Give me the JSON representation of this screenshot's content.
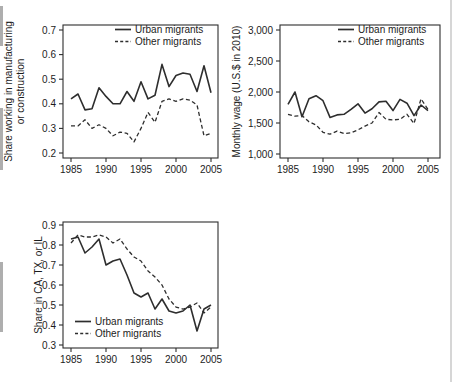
{
  "figure_caption": "",
  "chart_data": [
    {
      "id": "share-manufacturing-chart",
      "type": "line",
      "x": [
        1985,
        1986,
        1987,
        1988,
        1989,
        1990,
        1991,
        1992,
        1993,
        1994,
        1995,
        1996,
        1997,
        1998,
        1999,
        2000,
        2001,
        2002,
        2003,
        2004,
        2005
      ],
      "xlim": [
        1985,
        2005
      ],
      "series": [
        {
          "name": "Urban migrants",
          "line": "solid",
          "values": [
            0.42,
            0.44,
            0.375,
            0.38,
            0.465,
            0.43,
            0.4,
            0.4,
            0.45,
            0.41,
            0.49,
            0.42,
            0.435,
            0.56,
            0.47,
            0.515,
            0.525,
            0.52,
            0.45,
            0.555,
            0.445
          ]
        },
        {
          "name": "Other migrants",
          "line": "dashed",
          "values": [
            0.31,
            0.31,
            0.335,
            0.3,
            0.315,
            0.3,
            0.27,
            0.285,
            0.28,
            0.245,
            0.3,
            0.365,
            0.325,
            0.41,
            0.42,
            0.41,
            0.42,
            0.415,
            0.395,
            0.27,
            0.28
          ]
        }
      ],
      "title": "",
      "xlabel": "",
      "ylabel": [
        "Share working in manufacturing",
        "or construction"
      ],
      "ylim": [
        0.2,
        0.7
      ],
      "yticks": [
        0.2,
        0.3,
        0.4,
        0.5,
        0.6,
        0.7
      ],
      "ytick_labels": [
        "0.2",
        "0.3",
        "0.4",
        "0.5",
        "0.6",
        "0.7"
      ],
      "xticks": [
        1985,
        1990,
        1995,
        2000,
        2005
      ],
      "xtick_labels": [
        "1985",
        "1990",
        "1995",
        "2000",
        "2005"
      ],
      "legend_position": "top-right",
      "grid": false,
      "line_color": "#2e2e2e"
    },
    {
      "id": "monthly-wage-chart",
      "type": "line",
      "x": [
        1985,
        1986,
        1987,
        1988,
        1989,
        1990,
        1991,
        1992,
        1993,
        1994,
        1995,
        1996,
        1997,
        1998,
        1999,
        2000,
        2001,
        2002,
        2003,
        2004,
        2005
      ],
      "xlim": [
        1985,
        2005
      ],
      "series": [
        {
          "name": "Urban migrants",
          "line": "solid",
          "values": [
            1800,
            2000,
            1600,
            1890,
            1940,
            1860,
            1590,
            1630,
            1640,
            1720,
            1810,
            1660,
            1730,
            1840,
            1850,
            1700,
            1880,
            1820,
            1620,
            1790,
            1700
          ]
        },
        {
          "name": "Other migrants",
          "line": "dashed",
          "values": [
            1640,
            1610,
            1620,
            1520,
            1470,
            1350,
            1320,
            1370,
            1330,
            1340,
            1390,
            1450,
            1500,
            1670,
            1560,
            1550,
            1560,
            1640,
            1490,
            1890,
            1720
          ]
        }
      ],
      "title": "",
      "xlabel": "",
      "ylabel": [
        "Monthly wage (U.S.$ in 2010)"
      ],
      "ylim": [
        1000,
        3000
      ],
      "yticks": [
        1000,
        1500,
        2000,
        2500,
        3000
      ],
      "ytick_labels": [
        "1,000",
        "1,500",
        "2,000",
        "2,500",
        "3,000"
      ],
      "xticks": [
        1985,
        1990,
        1995,
        2000,
        2005
      ],
      "xtick_labels": [
        "1985",
        "1990",
        "1995",
        "2000",
        "2005"
      ],
      "legend_position": "top-right",
      "grid": false,
      "line_color": "#2e2e2e"
    },
    {
      "id": "share-ca-tx-il-chart",
      "type": "line",
      "x": [
        1985,
        1986,
        1987,
        1988,
        1989,
        1990,
        1991,
        1992,
        1993,
        1994,
        1995,
        1996,
        1997,
        1998,
        1999,
        2000,
        2001,
        2002,
        2003,
        2004,
        2005
      ],
      "xlim": [
        1985,
        2005
      ],
      "series": [
        {
          "name": "Urban migrants",
          "line": "solid",
          "values": [
            0.83,
            0.84,
            0.76,
            0.79,
            0.83,
            0.7,
            0.72,
            0.73,
            0.65,
            0.56,
            0.54,
            0.56,
            0.48,
            0.53,
            0.47,
            0.46,
            0.47,
            0.5,
            0.37,
            0.48,
            0.5
          ]
        },
        {
          "name": "Other migrants",
          "line": "dashed",
          "values": [
            0.81,
            0.85,
            0.84,
            0.84,
            0.85,
            0.84,
            0.81,
            0.83,
            0.78,
            0.74,
            0.72,
            0.67,
            0.64,
            0.6,
            0.53,
            0.49,
            0.48,
            0.49,
            0.51,
            0.46,
            0.49
          ]
        }
      ],
      "title": "",
      "xlabel": "",
      "ylabel": [
        "Share in CA, TX, or IL"
      ],
      "ylim": [
        0.3,
        0.9
      ],
      "yticks": [
        0.3,
        0.4,
        0.5,
        0.6,
        0.7,
        0.8,
        0.9
      ],
      "ytick_labels": [
        "0.3",
        "0.4",
        "0.5",
        "0.6",
        "0.7",
        "0.8",
        "0.9"
      ],
      "xticks": [
        1985,
        1990,
        1995,
        2000,
        2005
      ],
      "xtick_labels": [
        "1985",
        "1990",
        "1995",
        "2000",
        "2005"
      ],
      "legend_position": "bottom-left",
      "grid": false,
      "line_color": "#2e2e2e"
    }
  ]
}
